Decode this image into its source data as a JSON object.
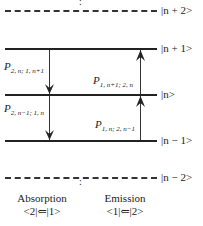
{
  "levels": [
    {
      "ket": "|n + 2>",
      "style": "dashed"
    },
    {
      "ket": "|n + 1>",
      "style": "solid"
    },
    {
      "ket": "|n>",
      "style": "solid"
    },
    {
      "ket": "|n − 1>",
      "style": "solid"
    },
    {
      "ket": "|n − 2>",
      "style": "dashed"
    }
  ],
  "transitions": [
    {
      "label_main": "P",
      "label_sub": "2, n; 1, n+1",
      "direction": "down",
      "from": "|n + 1>",
      "to": "|n>"
    },
    {
      "label_main": "P",
      "label_sub": "1, n+1; 2, n",
      "direction": "up",
      "from": "|n>",
      "to": "|n + 1>"
    },
    {
      "label_main": "P",
      "label_sub": "2, n−1; 1, n",
      "direction": "down",
      "from": "|n>",
      "to": "|n − 1>"
    },
    {
      "label_main": "P",
      "label_sub": "1, n; 2, n−1",
      "direction": "up",
      "from": "|n − 1>",
      "to": "|n>"
    }
  ],
  "captions": {
    "absorption": {
      "title": "Absorption",
      "formula": "<2|⇐|1>"
    },
    "emission": {
      "title": "Emission",
      "formula": "<1|⇐|2>"
    }
  },
  "ellipsis": ":"
}
